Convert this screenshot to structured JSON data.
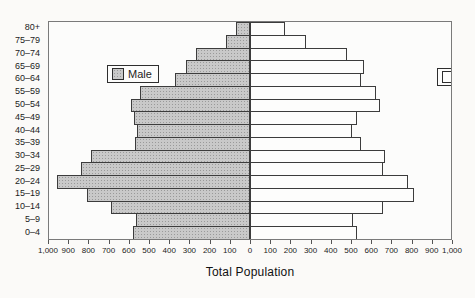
{
  "chart_data": {
    "type": "bar",
    "subtype": "population-pyramid",
    "title": "",
    "xlabel": "Total Population",
    "ylabel": "",
    "grid": false,
    "xlim_per_side": [
      0,
      1000
    ],
    "tick_step": 100,
    "tick_labels": [
      "1,000",
      "900",
      "800",
      "700",
      "600",
      "500",
      "400",
      "300",
      "200",
      "100",
      "0",
      "100",
      "200",
      "300",
      "400",
      "500",
      "600",
      "700",
      "800",
      "900",
      "1,000"
    ],
    "categories": [
      "80+",
      "75–79",
      "70–74",
      "65–69",
      "60–64",
      "55–59",
      "50–54",
      "45–49",
      "40–44",
      "35–39",
      "30–34",
      "25–29",
      "20–24",
      "15–19",
      "10–14",
      "5–9",
      "0–4"
    ],
    "series": [
      {
        "name": "Male",
        "side": "left",
        "fill": "#c9c9c9",
        "values": [
          70,
          120,
          270,
          320,
          375,
          545,
          590,
          575,
          560,
          570,
          790,
          840,
          960,
          810,
          690,
          565,
          580
        ]
      },
      {
        "name": "Female",
        "side": "right",
        "fill": "#fdfdfc",
        "values": [
          175,
          280,
          485,
          565,
          550,
          625,
          645,
          530,
          505,
          550,
          670,
          660,
          785,
          815,
          660,
          510,
          530
        ]
      }
    ],
    "legend": {
      "male_label": "Male",
      "female_label": "Female",
      "male_position": "inside top-left",
      "female_position": "inside top-right"
    }
  },
  "colors": {
    "male_fill": "#c9c9c9",
    "female_fill": "#fdfdfc",
    "bar_border": "#3c3c3c",
    "frame": "#7a7a7a",
    "text": "#1c1c1c",
    "background": "#fbfaf8"
  }
}
